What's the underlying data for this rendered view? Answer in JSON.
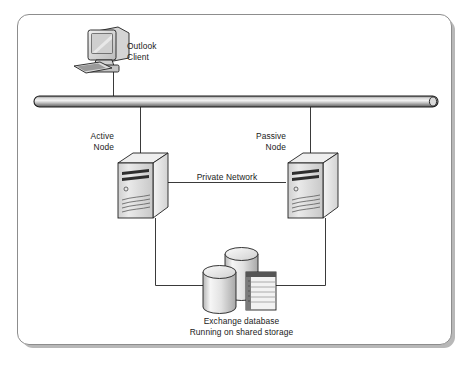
{
  "diagram": {
    "background_color": "#ffffff",
    "frame_border_color": "#8d8d8d",
    "frame_shadow_color": "#b8b8b8",
    "line_color": "#3a3a3a",
    "text_color": "#1a1a1a"
  },
  "labels": {
    "outlook_client": "Outlook\nClient",
    "outlook_client_line1": "Outlook",
    "outlook_client_line2": "Client",
    "active_node_line1": "Active",
    "active_node_line2": "Node",
    "passive_node_line1": "Passive",
    "passive_node_line2": "Node",
    "private_network": "Private Network",
    "storage_line1": "Exchange database",
    "storage_line2": "Running on shared storage"
  },
  "nodes": [
    {
      "id": "outlook-client",
      "type": "workstation",
      "label": "Outlook Client",
      "x": 100,
      "y": 50
    },
    {
      "id": "network-bus",
      "type": "bus",
      "label": "",
      "x": 236,
      "y": 101
    },
    {
      "id": "active-node",
      "type": "server",
      "label": "Active Node",
      "x": 140,
      "y": 185
    },
    {
      "id": "passive-node",
      "type": "server",
      "label": "Passive Node",
      "x": 310,
      "y": 185
    },
    {
      "id": "shared-storage",
      "type": "storage",
      "label": "Exchange database Running on shared storage",
      "x": 243,
      "y": 280
    }
  ],
  "connections": [
    {
      "id": "client-to-bus",
      "from": "outlook-client",
      "to": "network-bus",
      "label": ""
    },
    {
      "id": "bus-to-active",
      "from": "network-bus",
      "to": "active-node",
      "label": ""
    },
    {
      "id": "bus-to-passive",
      "from": "network-bus",
      "to": "passive-node",
      "label": ""
    },
    {
      "id": "active-to-passive",
      "from": "active-node",
      "to": "passive-node",
      "label": "Private Network"
    },
    {
      "id": "active-to-storage",
      "from": "active-node",
      "to": "shared-storage",
      "label": ""
    },
    {
      "id": "passive-to-storage",
      "from": "passive-node",
      "to": "shared-storage",
      "label": ""
    }
  ],
  "icons": {
    "workstation": "monitor-icon",
    "server": "server-tower-icon",
    "database": "database-cylinder-icon",
    "table": "table-document-icon",
    "bus": "network-bus-icon"
  }
}
